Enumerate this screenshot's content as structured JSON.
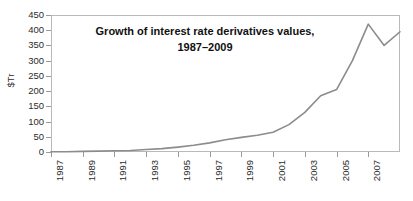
{
  "chart_data": {
    "type": "line",
    "title": "Growth of interest rate derivatives values, 1987–2009",
    "title_line1": "Growth of interest rate derivatives values,",
    "title_line2": "1987–2009",
    "xlabel": "",
    "ylabel": "$Tr",
    "ylim": [
      0,
      450
    ],
    "xlim": [
      1987,
      2009
    ],
    "y_ticks": [
      0,
      50,
      100,
      150,
      200,
      250,
      300,
      350,
      400,
      450
    ],
    "x_ticks": [
      1987,
      1989,
      1991,
      1993,
      1995,
      1997,
      1999,
      2001,
      2003,
      2005,
      2007
    ],
    "x_tick_labels": [
      "1987",
      "1989",
      "1991",
      "1993",
      "1995",
      "1997",
      "1999",
      "2001",
      "2003",
      "2005",
      "2007"
    ],
    "grid": false,
    "legend": null,
    "legend_position": "none",
    "line_color": "#8c8c8c",
    "axis_color": "#b9b9b9",
    "x": [
      1987,
      1988,
      1989,
      1990,
      1991,
      1992,
      1993,
      1994,
      1995,
      1996,
      1997,
      1998,
      1999,
      2000,
      2001,
      2002,
      2003,
      2004,
      2005,
      2006,
      2007,
      2008,
      2009
    ],
    "values": [
      1,
      1,
      2,
      3,
      4,
      5,
      8,
      11,
      16,
      22,
      30,
      40,
      48,
      55,
      65,
      90,
      130,
      185,
      205,
      300,
      420,
      350,
      395
    ],
    "series": [
      {
        "name": "Interest rate derivatives notional value",
        "units": "$Tr",
        "values": [
          1,
          1,
          2,
          3,
          4,
          5,
          8,
          11,
          16,
          22,
          30,
          40,
          48,
          55,
          65,
          90,
          130,
          185,
          205,
          300,
          420,
          350,
          395
        ]
      }
    ],
    "annotations": []
  }
}
